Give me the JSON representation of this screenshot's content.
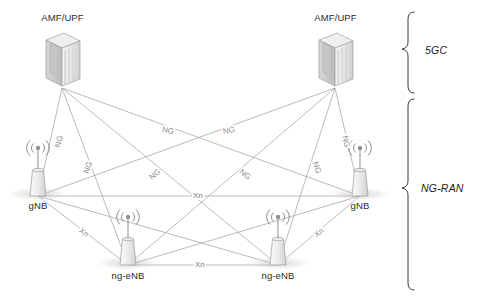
{
  "diagram": {
    "background_color": "#ffffff",
    "line_color": "#9a9a9a",
    "label_color": "#8c8c8c",
    "text_color": "#2b2b2b"
  },
  "core_nodes": [
    {
      "id": "amf-upf-left",
      "label": "AMF/UPF",
      "icon": "server-icon",
      "x": 62,
      "y": 85
    },
    {
      "id": "amf-upf-right",
      "label": "AMF/UPF",
      "icon": "server-icon",
      "x": 335,
      "y": 85
    }
  ],
  "ran_nodes": [
    {
      "id": "gnb-left",
      "label": "gNB",
      "icon": "base-station-icon",
      "x": 38,
      "y": 196
    },
    {
      "id": "gnb-right",
      "label": "gNB",
      "icon": "base-station-icon",
      "x": 360,
      "y": 196
    },
    {
      "id": "ng-enb-left",
      "label": "ng-eNB",
      "icon": "base-station-icon",
      "x": 128,
      "y": 265
    },
    {
      "id": "ng-enb-right",
      "label": "ng-eNB",
      "icon": "base-station-icon",
      "x": 278,
      "y": 265
    }
  ],
  "links": [
    {
      "id": "ng-1",
      "type": "NG",
      "label": "NG",
      "from": "amf-upf-left",
      "to": "gnb-left"
    },
    {
      "id": "ng-2",
      "type": "NG",
      "label": "NG",
      "from": "amf-upf-left",
      "to": "ng-enb-left"
    },
    {
      "id": "ng-3",
      "type": "NG",
      "label": "NG",
      "from": "amf-upf-left",
      "to": "ng-enb-right"
    },
    {
      "id": "ng-4",
      "type": "NG",
      "label": "NG",
      "from": "amf-upf-left",
      "to": "gnb-right"
    },
    {
      "id": "ng-5",
      "type": "NG",
      "label": "NG",
      "from": "amf-upf-right",
      "to": "gnb-right"
    },
    {
      "id": "ng-6",
      "type": "NG",
      "label": "NG",
      "from": "amf-upf-right",
      "to": "ng-enb-right"
    },
    {
      "id": "ng-7",
      "type": "NG",
      "label": "NG",
      "from": "amf-upf-right",
      "to": "ng-enb-left"
    },
    {
      "id": "ng-8",
      "type": "NG",
      "label": "NG",
      "from": "amf-upf-right",
      "to": "gnb-left"
    },
    {
      "id": "xn-1",
      "type": "Xn",
      "label": "Xn",
      "from": "gnb-left",
      "to": "gnb-right"
    },
    {
      "id": "xn-2",
      "type": "Xn",
      "label": "Xn",
      "from": "ng-enb-left",
      "to": "ng-enb-right"
    },
    {
      "id": "xn-3",
      "type": "Xn",
      "label": "Xn",
      "from": "gnb-left",
      "to": "ng-enb-left"
    },
    {
      "id": "xn-4",
      "type": "Xn",
      "label": "Xn",
      "from": "gnb-right",
      "to": "ng-enb-right"
    },
    {
      "id": "xn-5",
      "type": "Xn",
      "label": "",
      "from": "gnb-left",
      "to": "ng-enb-right"
    },
    {
      "id": "xn-6",
      "type": "Xn",
      "label": "",
      "from": "gnb-right",
      "to": "ng-enb-left"
    }
  ],
  "link_labels": {
    "ng": "NG",
    "xn": "Xn"
  },
  "groups": [
    {
      "id": "group-5gc",
      "label": "5GC",
      "brace_top": 10,
      "brace_bottom": 95
    },
    {
      "id": "group-ng-ran",
      "label": "NG-RAN",
      "brace_top": 97,
      "brace_bottom": 292
    }
  ]
}
